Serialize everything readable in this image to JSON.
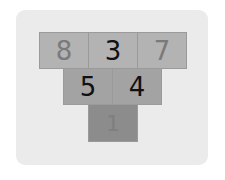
{
  "puzzle": {
    "rows": [
      [
        {
          "value": "8",
          "faded": true
        },
        {
          "value": "3",
          "faded": false
        },
        {
          "value": "7",
          "faded": true
        }
      ],
      [
        {
          "value": "5",
          "faded": false
        },
        {
          "value": "4",
          "faded": false
        }
      ],
      [
        {
          "value": "1",
          "faded": true
        }
      ]
    ]
  },
  "colors": {
    "card": "#ebebeb",
    "row1": "#b3b3b3",
    "row2": "#a3a3a3",
    "row3": "#8c8c8c",
    "text": "#111111",
    "faded_text": "#7a7a7a"
  }
}
